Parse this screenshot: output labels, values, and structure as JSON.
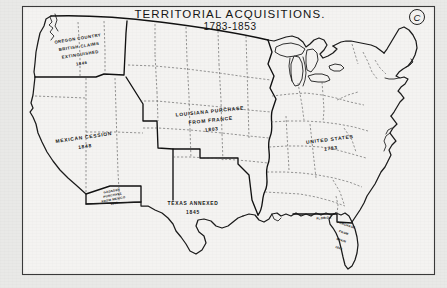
{
  "figure": {
    "marker": "C",
    "title": "TERRITORIAL  ACQUISITIONS.",
    "subtitle": "1783-1853"
  },
  "territories": [
    {
      "id": "oregon-country",
      "lines": [
        "OREGON COUNTRY",
        "BRITISH CLAIMS",
        "EXTINGUISHED",
        "1846"
      ],
      "line1": "OREGON COUNTRY",
      "line2": "BRITISH CLAIMS",
      "line3": "EXTINGUISHED",
      "year": "1846"
    },
    {
      "id": "mexican-cession",
      "line1": "MEXICAN CESSION",
      "year": "1848"
    },
    {
      "id": "louisiana-purchase",
      "line1": "LOUISIANA PURCHASE",
      "line2": "FROM FRANCE",
      "year": "1803"
    },
    {
      "id": "texas-annexed",
      "line1": "TEXAS ANNEXED",
      "year": "1845"
    },
    {
      "id": "united-states",
      "line1": "UNITED STATES",
      "year": "1783"
    },
    {
      "id": "gadsden-purchase",
      "line1": "GADSDEN",
      "line2": "PURCHASE",
      "line3": "FROM MEXICO",
      "year": "1853"
    },
    {
      "id": "florida-purchase",
      "line1": "FLORIDA",
      "line2": "PURCHASE",
      "line3": "FROM",
      "line4": "SPAIN",
      "year": "1821"
    }
  ],
  "colors": {
    "paper": "#f4f3f1",
    "margin": "#e9e9e7",
    "ink": "#1b1b1b",
    "state_border": "#555555"
  }
}
